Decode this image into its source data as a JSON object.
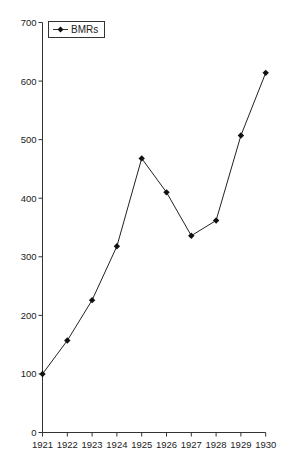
{
  "chart_data": {
    "type": "line",
    "title": "",
    "xlabel": "",
    "ylabel": "",
    "categories": [
      "1921",
      "1922",
      "1923",
      "1924",
      "1925",
      "1926",
      "1927",
      "1928",
      "1929",
      "1930"
    ],
    "series": [
      {
        "name": "BMRs",
        "values": [
          100,
          157,
          226,
          318,
          468,
          410,
          336,
          362,
          507,
          614
        ],
        "marker": "diamond",
        "color": "#222222"
      }
    ],
    "ylim": [
      0,
      700
    ],
    "yticks": [
      0,
      100,
      200,
      300,
      400,
      500,
      600,
      700
    ],
    "grid": false,
    "legend_position": "top-left-inside"
  },
  "legend": {
    "label": "BMRs"
  }
}
